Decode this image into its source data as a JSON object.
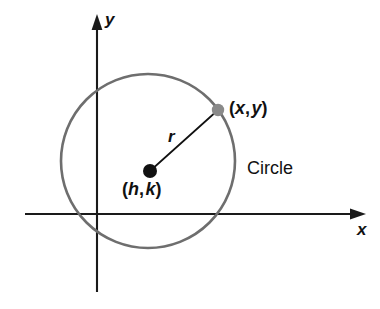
{
  "figure": {
    "kind": "circle-in-coordinate-plane",
    "background_color": "#ffffff",
    "axes": {
      "x_axis_label": "x",
      "y_axis_label": "y",
      "axis_color": "#1a1a1a",
      "x_axis_y": 214,
      "y_axis_x": 97
    },
    "circle": {
      "label": "Circle",
      "stroke_color": "#6e6e6e",
      "center_x": 148,
      "center_y": 161,
      "radius": 87
    },
    "center_point": {
      "label": "(h, k)",
      "open_paren": "(",
      "first_var": "h",
      "comma": ",",
      "second_var": "k",
      "close_paren": ")",
      "dot_color": "#111111",
      "x": 150,
      "y": 171
    },
    "circle_point": {
      "label": "(x, y)",
      "open_paren": "(",
      "first_var": "x",
      "comma": ",",
      "second_var": "y",
      "close_paren": ")",
      "dot_color": "#8a8a8a",
      "x": 218,
      "y": 110
    },
    "radius_segment": {
      "label": "r",
      "stroke_color": "#111111"
    }
  }
}
